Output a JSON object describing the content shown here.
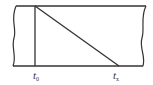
{
  "diagram": {
    "type": "strip-with-diagonal",
    "stroke_color": "#333333",
    "labels": {
      "start": {
        "base": "t",
        "sub": "0"
      },
      "end": {
        "base": "t",
        "sub": "x"
      }
    }
  }
}
